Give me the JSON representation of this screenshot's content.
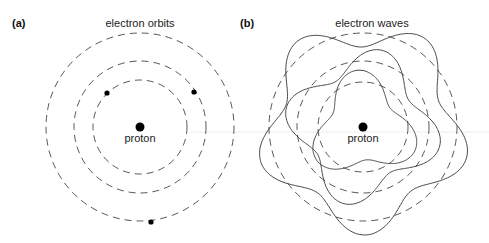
{
  "panels": [
    {
      "id": "a",
      "label": "(a)",
      "title": "electron orbits",
      "nucleus_label": "proton",
      "center": [
        140,
        127
      ],
      "orbit_radii": [
        47,
        66,
        94
      ],
      "electrons": [
        [
          107,
          93
        ],
        [
          194,
          92
        ],
        [
          151,
          222
        ]
      ]
    },
    {
      "id": "b",
      "label": "(b)",
      "title": "electron waves",
      "nucleus_label": "proton",
      "center": [
        363,
        127
      ],
      "orbit_radii": [
        45,
        66,
        94
      ],
      "wave_lobes": [
        3,
        4,
        5
      ]
    }
  ]
}
